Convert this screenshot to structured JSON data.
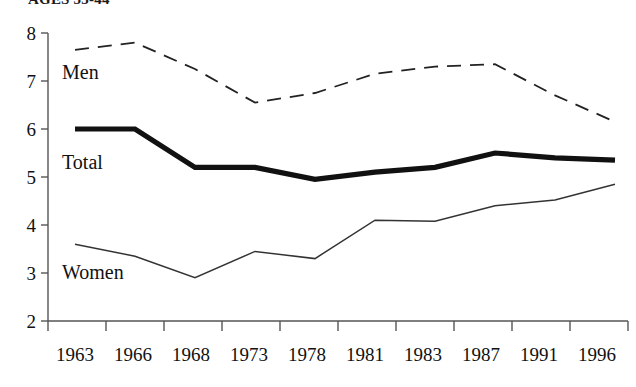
{
  "chart_data": {
    "type": "line",
    "title": "AGES 35-44",
    "xlabel": "",
    "ylabel": "",
    "categories": [
      "1963",
      "1966",
      "1968",
      "1973",
      "1978",
      "1981",
      "1983",
      "1987",
      "1991",
      "1996"
    ],
    "ylim": [
      2,
      8
    ],
    "yticks": [
      2,
      3,
      4,
      5,
      6,
      7,
      8
    ],
    "grid": false,
    "legend": "inline-labels",
    "series": [
      {
        "name": "Men",
        "style": "dashed",
        "color": "#222222",
        "values": [
          7.65,
          7.8,
          7.25,
          6.55,
          6.75,
          7.15,
          7.3,
          7.35,
          6.7,
          6.15
        ]
      },
      {
        "name": "Total",
        "style": "thick-solid",
        "color": "#111111",
        "values": [
          6.0,
          6.0,
          5.2,
          5.2,
          4.95,
          5.1,
          5.2,
          5.5,
          5.4,
          5.35
        ]
      },
      {
        "name": "Women",
        "style": "thin-solid",
        "color": "#333333",
        "values": [
          3.6,
          3.35,
          2.9,
          3.45,
          3.3,
          4.1,
          4.08,
          4.4,
          4.52,
          4.85
        ]
      }
    ],
    "annotations": [
      {
        "text": "Men",
        "x_value": "1963",
        "y_value": 7.0
      },
      {
        "text": "Total",
        "x_value": "1963",
        "y_value": 5.35
      },
      {
        "text": "Women",
        "x_value": "1963",
        "y_value": 3.05
      }
    ]
  },
  "axis": {
    "y_labels": [
      "8",
      "7",
      "6",
      "5",
      "4",
      "3",
      "2"
    ],
    "x_labels": [
      "1963",
      "1966",
      "1968",
      "1973",
      "1978",
      "1981",
      "1983",
      "1987",
      "1991",
      "1996"
    ]
  },
  "series_labels": {
    "men": "Men",
    "total": "Total",
    "women": "Women"
  }
}
